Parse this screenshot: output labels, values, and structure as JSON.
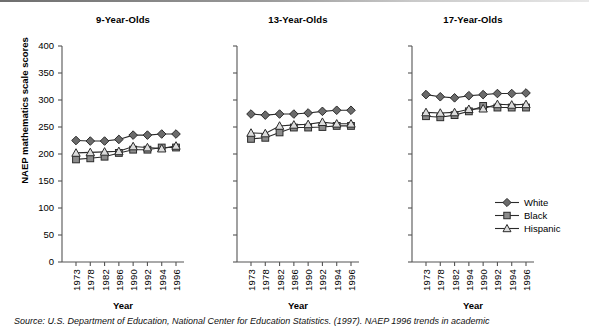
{
  "figure": {
    "y_axis_title": "NAEP mathematics scale scores",
    "x_axis_title": "Year",
    "source_note": "Source: U.S. Department of Education, National Center for Education Statistics. (1997). NAEP 1996 trends in academic"
  },
  "legend": {
    "position": "bottom-right",
    "items": [
      {
        "label": "White",
        "marker": "diamond",
        "color": "#6b6b6b"
      },
      {
        "label": "Black",
        "marker": "square",
        "color": "#8a8a8a"
      },
      {
        "label": "Hispanic",
        "marker": "triangle",
        "color": "#d0d0d0"
      }
    ]
  },
  "colors": {
    "line": "#2b2b2b",
    "white_series": "#6b6b6b",
    "black_series": "#8c8c8c",
    "hispanic_series": "#dcdcdc",
    "axis": "#555555",
    "text": "#000000"
  },
  "chart_data": [
    {
      "type": "line",
      "title": "9-Year-Olds",
      "xlabel": "Year",
      "ylabel": "NAEP mathematics scale scores",
      "x": [
        "1973",
        "1978",
        "1982",
        "1986",
        "1990",
        "1992",
        "1994",
        "1996"
      ],
      "ylim": [
        0,
        400
      ],
      "yticks": [
        0,
        50,
        100,
        150,
        200,
        250,
        300,
        350,
        400
      ],
      "grid": false,
      "series": [
        {
          "name": "White",
          "marker": "diamond",
          "values": [
            225,
            224,
            224,
            227,
            235,
            235,
            237,
            237
          ]
        },
        {
          "name": "Black",
          "marker": "square",
          "values": [
            190,
            192,
            195,
            202,
            208,
            208,
            212,
            212
          ]
        },
        {
          "name": "Hispanic",
          "marker": "triangle",
          "values": [
            202,
            203,
            204,
            205,
            214,
            212,
            210,
            215
          ]
        }
      ]
    },
    {
      "type": "line",
      "title": "13-Year-Olds",
      "xlabel": "Year",
      "ylabel": "NAEP mathematics scale scores",
      "x": [
        "1973",
        "1978",
        "1982",
        "1986",
        "1990",
        "1992",
        "1994",
        "1996"
      ],
      "ylim": [
        0,
        400
      ],
      "yticks": [
        0,
        50,
        100,
        150,
        200,
        250,
        300,
        350,
        400
      ],
      "grid": false,
      "series": [
        {
          "name": "White",
          "marker": "diamond",
          "values": [
            274,
            272,
            274,
            274,
            276,
            279,
            281,
            281
          ]
        },
        {
          "name": "Black",
          "marker": "square",
          "values": [
            228,
            230,
            240,
            249,
            249,
            250,
            252,
            252
          ]
        },
        {
          "name": "Hispanic",
          "marker": "triangle",
          "values": [
            239,
            238,
            252,
            254,
            255,
            259,
            256,
            256
          ]
        }
      ]
    },
    {
      "type": "line",
      "title": "17-Year-Olds",
      "xlabel": "Year",
      "ylabel": "NAEP mathematics scale scores",
      "x": [
        "1973",
        "1978",
        "1982",
        "1994",
        "1990",
        "1992",
        "1994",
        "1996"
      ],
      "ylim": [
        0,
        400
      ],
      "yticks": [
        0,
        50,
        100,
        150,
        200,
        250,
        300,
        350,
        400
      ],
      "grid": false,
      "series": [
        {
          "name": "White",
          "marker": "diamond",
          "values": [
            310,
            306,
            304,
            308,
            310,
            312,
            312,
            313
          ]
        },
        {
          "name": "Black",
          "marker": "square",
          "values": [
            270,
            268,
            272,
            279,
            289,
            286,
            286,
            286
          ]
        },
        {
          "name": "Hispanic",
          "marker": "triangle",
          "values": [
            277,
            276,
            277,
            283,
            284,
            292,
            291,
            292
          ]
        }
      ]
    }
  ]
}
